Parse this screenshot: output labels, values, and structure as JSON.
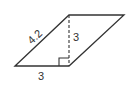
{
  "diagram": {
    "shape": "parallelogram",
    "stroke_color": "#333333",
    "vertices": {
      "top_left": [
        69,
        15
      ],
      "top_right": [
        124,
        15
      ],
      "bottom_right": [
        69,
        66
      ],
      "bottom_left": [
        15,
        66
      ]
    },
    "labels": {
      "slanted_side": "4.2",
      "height": "3",
      "base": "3"
    },
    "height_line": {
      "style": "dashed",
      "from": [
        69,
        15
      ],
      "to": [
        69,
        66
      ]
    },
    "right_angle_marker": true
  }
}
